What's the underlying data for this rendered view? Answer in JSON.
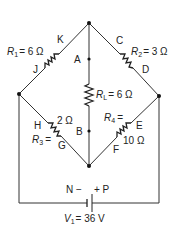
{
  "diagram": {
    "type": "bridge-circuit",
    "points": {
      "A": "A",
      "B": "B",
      "C": "C",
      "D": "D",
      "E": "E",
      "F": "F",
      "G": "G",
      "H": "H",
      "J": "J",
      "K": "K",
      "N": "N",
      "P": "P"
    },
    "resistors": {
      "r1": {
        "symbol": "R",
        "sub": "1",
        "value": "= 6 Ω"
      },
      "r2": {
        "symbol": "R",
        "sub": "2",
        "value": "= 3 Ω"
      },
      "rl": {
        "symbol": "R",
        "sub": "L",
        "value": "= 6 Ω"
      },
      "r3": {
        "symbol": "R",
        "sub": "3",
        "eq": "=",
        "value": "2 Ω"
      },
      "r4": {
        "symbol": "R",
        "sub": "4",
        "eq": "=",
        "value": "10 Ω"
      }
    },
    "battery": {
      "neg_label": "N −",
      "pos_label": "+ P",
      "symbol": "V",
      "sub": "1",
      "value": "= 36 V"
    }
  }
}
